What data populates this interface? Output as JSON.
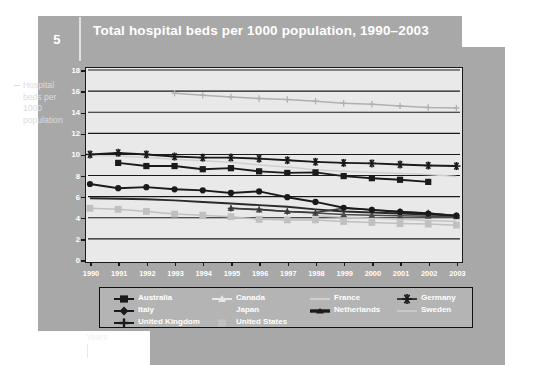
{
  "header": {
    "number": "5",
    "title": "Total hospital beds per 1000 population, 1990–2003"
  },
  "axis_caption": {
    "y": "Hospital beds per 1000 population",
    "x": "Years"
  },
  "chart_data": {
    "type": "line",
    "title": "Total hospital beds per 1000 population, 1990–2003",
    "xlabel": "Years",
    "ylabel": "Hospital beds per 1000 population",
    "ylim": [
      0,
      18
    ],
    "ytick_step": 2,
    "yticks": [
      "0",
      "2",
      "4",
      "6",
      "8",
      "10",
      "12",
      "14",
      "16",
      "18"
    ],
    "grid": true,
    "legend_position": "bottom",
    "categories": [
      "1990",
      "1991",
      "1992",
      "1993",
      "1994",
      "1995",
      "1996",
      "1997",
      "1998",
      "1999",
      "2000",
      "2001",
      "2002",
      "2003"
    ],
    "series": [
      {
        "name": "Australia",
        "marker": "filled-square",
        "color": "#1a1a1a",
        "values": [
          null,
          9.2,
          8.9,
          8.9,
          8.6,
          8.7,
          8.4,
          8.25,
          8.3,
          7.95,
          7.75,
          7.6,
          7.4,
          null
        ]
      },
      {
        "name": "Canada",
        "marker": "triangle",
        "color": "#4a4a4a",
        "values": [
          null,
          null,
          null,
          null,
          null,
          4.9,
          4.75,
          4.6,
          4.45,
          4.3,
          4.25,
          4.2,
          4.15,
          4.1
        ]
      },
      {
        "name": "France",
        "marker": "none",
        "color": "#cfcfcf",
        "values": [
          9.9,
          9.85,
          9.7,
          9.55,
          9.4,
          9.25,
          9.0,
          8.8,
          8.55,
          8.4,
          8.3,
          8.2,
          8.1,
          7.9
        ]
      },
      {
        "name": "Germany",
        "marker": "asterisk",
        "color": "#1a1a1a",
        "values": [
          10.0,
          10.15,
          10.0,
          9.8,
          9.7,
          9.7,
          9.6,
          9.45,
          9.3,
          9.2,
          9.15,
          9.05,
          8.95,
          8.9
        ]
      },
      {
        "name": "Italy",
        "marker": "filled-circle",
        "color": "#1a1a1a",
        "values": [
          7.2,
          6.8,
          6.9,
          6.7,
          6.6,
          6.35,
          6.5,
          5.95,
          5.5,
          4.95,
          4.75,
          4.55,
          4.4,
          4.2
        ]
      },
      {
        "name": "Japan",
        "marker": "plus",
        "color": "#b0b0b0",
        "values": [
          null,
          null,
          null,
          15.8,
          15.6,
          15.45,
          15.3,
          15.2,
          15.05,
          14.85,
          14.75,
          14.6,
          14.45,
          14.4
        ]
      },
      {
        "name": "Netherlands",
        "marker": "none",
        "color": "#2a2a2a",
        "values": [
          5.85,
          5.8,
          5.75,
          5.65,
          5.5,
          5.35,
          5.2,
          5.05,
          4.8,
          4.6,
          4.5,
          4.4,
          4.3,
          4.2
        ]
      },
      {
        "name": "Sweden",
        "marker": "none",
        "color": "#c4c4c4",
        "values": [
          null,
          null,
          null,
          null,
          null,
          null,
          null,
          null,
          4.2,
          4.05,
          3.95,
          3.85,
          3.75,
          3.65
        ]
      },
      {
        "name": "United Kingdom",
        "marker": "plus",
        "color": "#3a3a3a",
        "values": [
          null,
          null,
          null,
          null,
          null,
          4.9,
          4.8,
          4.6,
          4.5,
          4.9,
          4.75,
          4.6,
          4.45,
          4.2
        ]
      },
      {
        "name": "United States",
        "marker": "filled-square-gray",
        "color": "#c0c0c0",
        "values": [
          4.9,
          4.8,
          4.6,
          4.35,
          4.25,
          4.1,
          3.85,
          3.8,
          3.8,
          3.65,
          3.55,
          3.45,
          3.4,
          3.3
        ]
      }
    ]
  },
  "legend": {
    "rows": [
      [
        {
          "label": "Australia",
          "marker": "filled-square",
          "color": "#1a1a1a"
        },
        {
          "label": "Canada",
          "marker": "triangle-light",
          "color": "#e8e8e8"
        },
        {
          "label": "France",
          "marker": "line-light",
          "color": "#cfcfcf"
        },
        {
          "label": "Germany",
          "marker": "asterisk",
          "color": "#1a1a1a"
        }
      ],
      [
        {
          "label": "Italy",
          "marker": "filled-diamond",
          "color": "#1a1a1a"
        },
        {
          "label": "Japan",
          "marker": "line-gray",
          "color": "#b4b4b4"
        },
        {
          "label": "Netherlands",
          "marker": "line-thick-dark",
          "color": "#1a1a1a"
        },
        {
          "label": "Sweden",
          "marker": "line-light2",
          "color": "#c9c9c9"
        }
      ],
      [
        {
          "label": "United Kingdom",
          "marker": "plus-dark",
          "color": "#1a1a1a"
        },
        {
          "label": "United States",
          "marker": "square-gray",
          "color": "#c0c0c0"
        }
      ]
    ]
  },
  "colors": {
    "panel": "#a8a8a8",
    "plot_bg": "#e9e9e9",
    "axis": "#1a1a1a",
    "legend_bg": "#b4b4b4",
    "text_light": "#ffffff"
  }
}
